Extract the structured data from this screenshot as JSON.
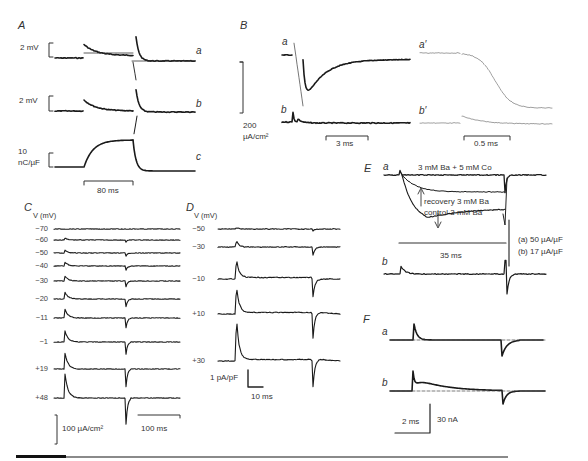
{
  "figure": {
    "panels": {
      "A": {
        "label": "A",
        "traces": [
          "a",
          "b",
          "c"
        ],
        "scale_a": "2 mV",
        "scale_b": "2 mV",
        "scale_c_line1": "10",
        "scale_c_line2": "nC/µF",
        "time_scale": "80 ms"
      },
      "B": {
        "label": "B",
        "traces": [
          "a",
          "b",
          "a′",
          "b′"
        ],
        "scale_value": "200",
        "scale_unit": "µA/cm²",
        "time_scale_left": "3 ms",
        "time_scale_right": "0.5 ms"
      },
      "C": {
        "label": "C",
        "axis_label": "V (mV)",
        "voltages": [
          "−70",
          "−60",
          "−50",
          "−40",
          "−30",
          "−20",
          "−11",
          "−1",
          "+19",
          "+48"
        ],
        "amplitude_scale": "100 µA/cm²",
        "time_scale": "100 ms"
      },
      "D": {
        "label": "D",
        "axis_label": "V (mV)",
        "voltages": [
          "−50",
          "−30",
          "−10",
          "+10",
          "+30"
        ],
        "amplitude_scale": "1 pA/pF",
        "time_scale": "10 ms"
      },
      "E": {
        "label": "E",
        "traces": [
          "a",
          "b"
        ],
        "annotation_co": "3  mM Ba + 5 mM Co",
        "annotation_recovery": "recovery 3  mM Ba",
        "annotation_control": "control 3  mM Ba",
        "time_scale": "35 ms",
        "scale_a": "(a) 50 µA/µF",
        "scale_b": "(b) 17 µA/µF"
      },
      "F": {
        "label": "F",
        "traces": [
          "a",
          "b"
        ],
        "time_scale": "2 ms",
        "amplitude_scale": "30 nA"
      }
    }
  }
}
